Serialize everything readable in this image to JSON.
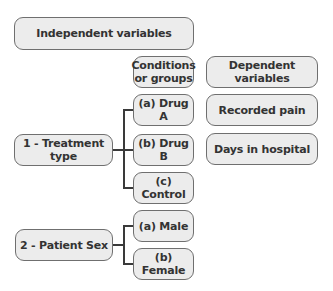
{
  "diagram": {
    "independent_header": "Independent variables",
    "conditions_header": "Conditions or groups",
    "dependent_header": "Dependent variables",
    "independent_variables": [
      {
        "label": "1 - Treatment type",
        "conditions": [
          "(a) Drug A",
          "(b) Drug B",
          "(c) Control"
        ]
      },
      {
        "label": "2 - Patient Sex",
        "conditions": [
          "(a) Male",
          "(b) Female"
        ]
      }
    ],
    "dependent_variables": [
      "Recorded pain",
      "Days in hospital"
    ],
    "colors": {
      "box_fill": "#ececec",
      "box_border": "#6f6f6f",
      "text": "#333333",
      "connector": "#3a3a3a"
    }
  }
}
